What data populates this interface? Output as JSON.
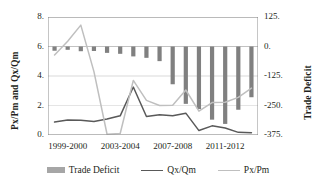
{
  "chart_data": {
    "type": "bar",
    "title": "",
    "xlabel": "",
    "ylabel": "Px/Pm and Qx/Qm",
    "y2label": "Trade Deficit",
    "ylim": [
      0,
      8
    ],
    "y2lim": [
      -375,
      125
    ],
    "grid": true,
    "legend_position": "bottom",
    "categories": [
      "1998-1999",
      "1999-2000",
      "2000-2001",
      "2001-2002",
      "2002-2003",
      "2003-2004",
      "2004-2005",
      "2005-2006",
      "2006-2007",
      "2007-2008",
      "2008-2009",
      "2009-2010",
      "2010-2011",
      "2011-2012",
      "2012-2013",
      "2013-2014"
    ],
    "x_tick_labels": [
      "1999-2000",
      "2003-2004",
      "2007-2008",
      "2011-2012"
    ],
    "x_tick_indices": [
      1,
      5,
      9,
      13
    ],
    "y_tick_labels": [
      "0.",
      "2.",
      "4.",
      "6.",
      "8."
    ],
    "y_tick_values": [
      0,
      2,
      4,
      6,
      8
    ],
    "y2_tick_labels": [
      "-375.",
      "-250.",
      "-125.",
      "0.",
      "125."
    ],
    "y2_tick_values": [
      -375,
      -250,
      -125,
      0,
      125
    ],
    "series": [
      {
        "name": "Trade Deficit",
        "type": "bar",
        "axis": "right",
        "color": "#808080",
        "values": [
          -18,
          -14,
          -20,
          -19,
          -27,
          -31,
          -42,
          -48,
          -62,
          -160,
          -243,
          -265,
          -310,
          -328,
          -268,
          -215
        ]
      },
      {
        "name": "Qx/Qm",
        "type": "line",
        "axis": "left",
        "color": "#595959",
        "values": [
          0.88,
          1.02,
          1.0,
          0.92,
          1.08,
          1.3,
          3.25,
          1.25,
          1.38,
          1.3,
          1.48,
          0.3,
          0.62,
          0.48,
          0.18,
          0.16
        ]
      },
      {
        "name": "Px/Pm",
        "type": "line",
        "axis": "left",
        "color": "#bfbfbf",
        "values": [
          5.42,
          6.35,
          7.45,
          4.3,
          0.05,
          0.1,
          3.7,
          2.35,
          2.0,
          2.02,
          3.05,
          1.62,
          2.2,
          2.22,
          2.55,
          3.18
        ]
      }
    ]
  },
  "legend": {
    "items": [
      {
        "label": "Trade Deficit",
        "marker": "bar-swatch"
      },
      {
        "label": "Qx/Qm",
        "marker": "line-swatch-dark"
      },
      {
        "label": "Px/Pm",
        "marker": "line-swatch-light"
      }
    ]
  },
  "axis_titles": {
    "left": "Px/Pm and Qx/Qm",
    "right": "Trade Deficit"
  },
  "colors": {
    "bar": "#808080",
    "line_dark": "#595959",
    "line_light": "#bfbfbf",
    "grid": "#d9d9d9",
    "axis": "#7f7f7f",
    "text": "#231f20"
  }
}
